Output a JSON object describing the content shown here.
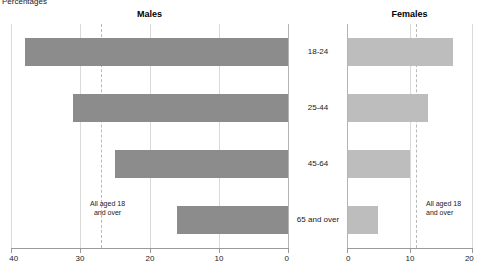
{
  "chart_data": {
    "type": "bar",
    "title": "",
    "unit_label": "Percentages",
    "orientation": "horizontal",
    "layout": "back-to-back population pyramid",
    "categories": [
      "18-24",
      "25-44",
      "45-64",
      "65 and over"
    ],
    "series": [
      {
        "name": "Males",
        "values": [
          38,
          31,
          25,
          16
        ]
      },
      {
        "name": "Females",
        "values": [
          17,
          13,
          10,
          5
        ]
      }
    ],
    "panels": [
      {
        "key": "males",
        "title": "Males",
        "axis_label": "",
        "xlim": [
          40,
          0
        ],
        "direction": "rtl",
        "ticks": [
          40,
          30,
          20,
          10,
          0
        ],
        "gridlines": [
          40,
          30,
          20,
          10,
          0
        ],
        "reference_line": {
          "value": 27,
          "label": "All aged 18 and over",
          "style": "dashed"
        },
        "bar_color": "#8c8c8c",
        "bars": [
          {
            "category": "18-24",
            "value": 38
          },
          {
            "category": "25-44",
            "value": 31
          },
          {
            "category": "45-64",
            "value": 25
          },
          {
            "category": "65 and over",
            "value": 16
          }
        ]
      },
      {
        "key": "females",
        "title": "Females",
        "axis_label": "",
        "xlim": [
          0,
          20
        ],
        "direction": "ltr",
        "ticks": [
          0,
          10,
          20
        ],
        "gridlines": [
          0,
          10,
          20
        ],
        "reference_line": {
          "value": 11,
          "label": "All aged 18 and over",
          "style": "dashed"
        },
        "bar_color": "#bdbdbd",
        "bars": [
          {
            "category": "18-24",
            "value": 17
          },
          {
            "category": "25-44",
            "value": 13
          },
          {
            "category": "45-64",
            "value": 10
          },
          {
            "category": "65 and over",
            "value": 5
          }
        ]
      }
    ],
    "annotations": [
      {
        "panel": "males",
        "text_line1": "All aged 18",
        "text_line2": "and over"
      },
      {
        "panel": "females",
        "text_line1": "All aged 18",
        "text_line2": "and over"
      }
    ],
    "grid": true,
    "legend": "none",
    "colors": {
      "males_bar": "#8c8c8c",
      "females_bar": "#bdbdbd",
      "gridline": "#d9d9d9",
      "reference_line": "#b9b9b9",
      "axis": "#9a9a9a",
      "text": "#1a1a1a",
      "background": "#ffffff"
    }
  },
  "labels": {
    "unit": "Percentages",
    "males_title": "Males",
    "females_title": "Females",
    "category_0": "18-24",
    "category_1": "25-44",
    "category_2": "45-64",
    "category_3": "65 and over",
    "annotation_line1": "All aged 18",
    "annotation_line2": "and over",
    "males_ticks": [
      "40",
      "30",
      "20",
      "10",
      "0"
    ],
    "females_ticks": [
      "0",
      "10",
      "20"
    ]
  }
}
